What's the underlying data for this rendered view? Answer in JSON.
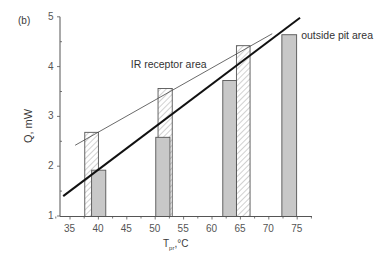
{
  "chart_data": {
    "type": "bar",
    "panel_label": "(b)",
    "title": "",
    "xlabel": "T_pr, °C",
    "xlabel_main": "T",
    "xlabel_sub": "pr",
    "xlabel_unit": ",°C",
    "ylabel": "Q, mW",
    "xlim": [
      33,
      77.5
    ],
    "ylim": [
      1,
      5
    ],
    "x_ticks": [
      35,
      40,
      45,
      50,
      55,
      60,
      65,
      70,
      75
    ],
    "y_ticks": [
      1,
      2,
      3,
      4,
      5
    ],
    "grid": false,
    "series": [
      {
        "name": "IR receptor area",
        "style": "hatched",
        "bars": [
          {
            "x_start": 37.6,
            "x_end": 40.0,
            "value": 2.68
          },
          {
            "x_start": 50.5,
            "x_end": 53.0,
            "value": 3.56
          },
          {
            "x_start": 64.3,
            "x_end": 66.7,
            "value": 4.42
          }
        ]
      },
      {
        "name": "outside pit area",
        "style": "gray",
        "bars": [
          {
            "x_start": 38.8,
            "x_end": 41.3,
            "value": 1.92
          },
          {
            "x_start": 50.1,
            "x_end": 52.6,
            "value": 2.58
          },
          {
            "x_start": 61.9,
            "x_end": 64.3,
            "value": 3.72
          },
          {
            "x_start": 72.3,
            "x_end": 74.9,
            "value": 4.64
          }
        ]
      }
    ],
    "trend_lines": [
      {
        "name": "IR receptor area",
        "weight": "thin",
        "x": [
          35.9,
          70.6
        ],
        "y": [
          2.42,
          4.66
        ]
      },
      {
        "name": "outside pit area",
        "weight": "thick",
        "x": [
          33.8,
          75.5
        ],
        "y": [
          1.4,
          4.98
        ]
      }
    ],
    "annotations": [
      {
        "text": "IR receptor area",
        "x": 45.7,
        "y": 4.04
      },
      {
        "text": "outside pit area",
        "x": 75.7,
        "y": 4.62
      }
    ],
    "colors": {
      "axis": "#555555",
      "bar_gray_fill": "#c8c8c8",
      "bar_edge": "#555555",
      "hatch": "#9a9a9a",
      "thin_line": "#444444",
      "thick_line": "#111111"
    }
  }
}
